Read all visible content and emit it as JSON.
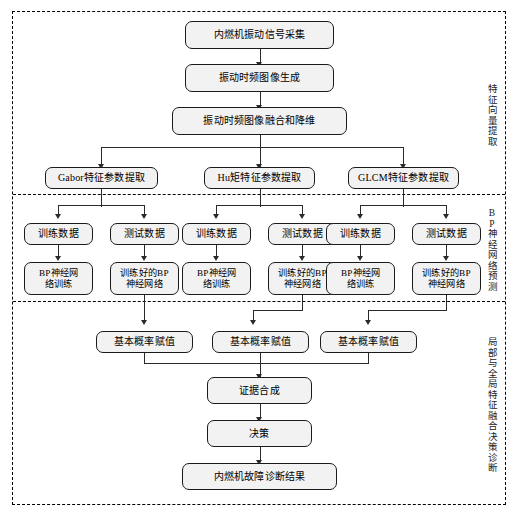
{
  "diagram": {
    "title_sections": [
      {
        "id": "feature-extraction",
        "label": "特征向量提取"
      },
      {
        "id": "bp-prediction",
        "label": "BP神经网络预测"
      },
      {
        "id": "fusion-decision",
        "label": "局部与全局特征融合决策诊断"
      }
    ],
    "nodes": {
      "acquire": "内燃机振动信号采集",
      "tf_image": "振动时频图像生成",
      "fuse_reduce": "振动时频图像融合和降维",
      "gabor": "Gabor特征参数提取",
      "hu": "Hu矩特征参数提取",
      "glcm": "GLCM特征参数提取",
      "train_data_1": "训练数据",
      "test_data_1": "测试数据",
      "train_data_2": "训练数据",
      "test_data_2": "测试数据",
      "train_data_3": "训练数据",
      "test_data_3": "测试数据",
      "bp_train_1": "BP神经网\n络训练",
      "bp_trained_1": "训练好的BP\n神经网络",
      "bp_train_2": "BP神经网\n络训练",
      "bp_trained_2": "训练好的BP\n神经网络",
      "bp_train_3": "BP神经网\n络训练",
      "bp_trained_3": "训练好的BP\n神经网络",
      "bpa_1": "基本概率赋值",
      "bpa_2": "基本概率赋值",
      "bpa_3": "基本概率赋值",
      "evidence": "证据合成",
      "decision": "决策",
      "result": "内燃机故障诊断结果"
    },
    "colors": {
      "node_fill": "#f2f2f2",
      "node_stroke": "#1b1b1b",
      "connector": "#2a2a2a",
      "frame": "#000000",
      "background": "#ffffff"
    }
  }
}
